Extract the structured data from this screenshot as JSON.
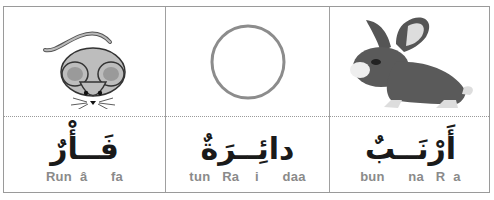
{
  "cards": [
    {
      "image": "mouse-icon",
      "arabic": "فَــأْرٌ",
      "transliteration": "Run  â      fa"
    },
    {
      "image": "circle-icon",
      "arabic": "دائِــرَةٌ",
      "transliteration": "tun   Ra    i      daa"
    },
    {
      "image": "rabbit-icon",
      "arabic": "أَرْنَــبٌ",
      "transliteration": "bun      na   R  a"
    }
  ],
  "colors": {
    "border": "#9a9a9a",
    "text": "#1a1a1a",
    "transliteration": "#8a8a8a"
  }
}
